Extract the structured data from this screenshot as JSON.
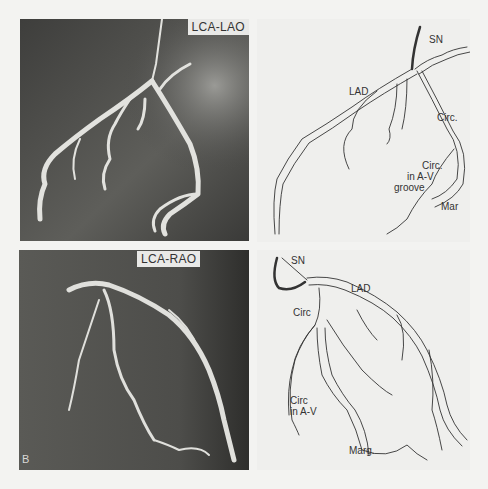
{
  "figure": {
    "letter": "B",
    "panels": [
      {
        "id": "top-left",
        "type": "angiogram",
        "view_label": "LCA-LAO"
      },
      {
        "id": "top-right",
        "type": "diagram",
        "labels": {
          "sn": "SN",
          "lad": "LAD",
          "circ": "Circ.",
          "circ_av_1": "Circ.",
          "circ_av_2": "in A-V",
          "circ_av_3": "groove",
          "mar": "Mar"
        }
      },
      {
        "id": "bottom-left",
        "type": "angiogram",
        "view_label": "LCA-RAO"
      },
      {
        "id": "bottom-right",
        "type": "diagram",
        "labels": {
          "sn": "SN",
          "lad": "LAD",
          "circ": "Circ",
          "circ_av_1": "Circ",
          "circ_av_2": "in A-V",
          "marg": "Marg."
        }
      }
    ]
  },
  "colors": {
    "page": "#f3f3f1",
    "angiogram_bg": "#4a4a48",
    "vessel": "#e4e4e0",
    "diagram_bg": "#efefed",
    "ink": "#333333"
  }
}
